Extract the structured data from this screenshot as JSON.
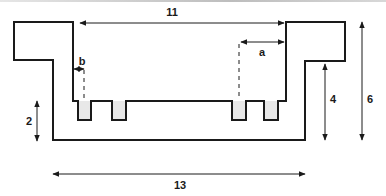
{
  "diagram": {
    "type": "cross-section dimension diagram",
    "colors": {
      "stroke": "#1a1a1a",
      "tooth_fill": "#e8e8e8",
      "top_bar": "#c8c8c8"
    },
    "labels": {
      "top_width": "11",
      "bottom_width": "13",
      "inner_height": "4",
      "outer_height": "6",
      "tooth_height": "2",
      "offset_a": "a",
      "offset_b": "b"
    },
    "dimensions": [
      {
        "label": "11",
        "meaning": "inner opening width",
        "orientation": "horizontal"
      },
      {
        "label": "13",
        "meaning": "overall bottom width",
        "orientation": "horizontal"
      },
      {
        "label": "4",
        "meaning": "inner wall height",
        "orientation": "vertical"
      },
      {
        "label": "6",
        "meaning": "overall height",
        "orientation": "vertical"
      },
      {
        "label": "2",
        "meaning": "base height",
        "orientation": "vertical"
      },
      {
        "label": "a",
        "meaning": "offset from right inner wall",
        "orientation": "horizontal"
      },
      {
        "label": "b",
        "meaning": "offset from left inner wall",
        "orientation": "horizontal"
      }
    ],
    "teeth_count": 4
  }
}
